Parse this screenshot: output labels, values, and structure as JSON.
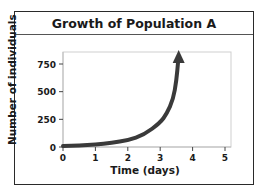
{
  "chart_data": {
    "type": "line",
    "title": "Growth of Population A",
    "xlabel": "Time (days)",
    "ylabel": "Number of individuals",
    "x_ticks": [
      0,
      1,
      2,
      3,
      4,
      5
    ],
    "y_ticks": [
      0,
      250,
      500,
      750
    ],
    "xlim": [
      0,
      5.2
    ],
    "ylim": [
      0,
      880
    ],
    "grid": false,
    "legend": null,
    "series": [
      {
        "name": "Population A",
        "x": [
          0,
          0.5,
          1,
          1.5,
          2,
          2.5,
          3,
          3.2,
          3.4,
          3.5,
          3.57
        ],
        "y": [
          10,
          14,
          22,
          38,
          60,
          110,
          220,
          300,
          430,
          600,
          850
        ],
        "style": "thick dark curve ending in arrowhead (exponential growth)"
      }
    ],
    "annotations": [
      "Arrowhead at end of curve indicating continued growth"
    ]
  },
  "title": "Growth of Population A",
  "axes": {
    "xlabel": "Time (days)",
    "ylabel": "Number of individuals",
    "x_tick_labels": [
      "0",
      "1",
      "2",
      "3",
      "4",
      "5"
    ],
    "y_tick_labels": [
      "0",
      "250",
      "500",
      "750"
    ]
  },
  "colors": {
    "curve": "#3a3a3a",
    "frame": "#2a2a2a",
    "plot_border": "#cccccc"
  }
}
